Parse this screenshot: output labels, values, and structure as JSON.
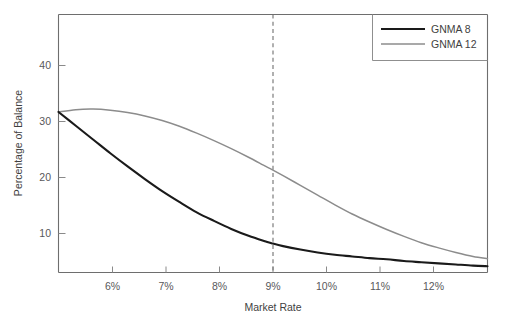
{
  "chart_data": {
    "type": "line",
    "title": "",
    "xlabel": "Market Rate",
    "ylabel": "Percentage of Balance",
    "xlim": [
      5.3,
      12.75
    ],
    "ylim": [
      2.0,
      47.0
    ],
    "grid": false,
    "legend_position": "top-right",
    "x_tick_labels": [
      "6%",
      "7%",
      "8%",
      "9%",
      "10%",
      "11%",
      "12%"
    ],
    "x_ticks": [
      6,
      7,
      8,
      9,
      10,
      11,
      12
    ],
    "y_tick_labels": [
      "10",
      "20",
      "30",
      "40"
    ],
    "y_ticks": [
      10,
      20,
      30,
      40
    ],
    "annotations": [
      {
        "name": "reference-line",
        "type": "vline",
        "x": 9,
        "style": "dashed"
      }
    ],
    "x": [
      5.3,
      5.6,
      5.9,
      6.2,
      6.5,
      6.8,
      7.1,
      7.4,
      7.7,
      8.0,
      8.3,
      8.6,
      8.9,
      9.0,
      9.2,
      9.5,
      9.8,
      10.1,
      10.4,
      10.7,
      11.0,
      11.3,
      11.6,
      11.9,
      12.2,
      12.5,
      12.75
    ],
    "series": [
      {
        "name": "GNMA 8",
        "color": "#1a1a1a",
        "line_width": 2.1,
        "values": [
          30.0,
          27.6,
          25.2,
          22.8,
          20.5,
          18.3,
          16.2,
          14.3,
          12.5,
          11.0,
          9.6,
          8.4,
          7.4,
          7.1,
          6.6,
          6.0,
          5.5,
          5.1,
          4.8,
          4.5,
          4.3,
          4.0,
          3.8,
          3.6,
          3.4,
          3.2,
          3.1
        ]
      },
      {
        "name": "GNMA 12",
        "color": "#8c8c8c",
        "line_width": 1.5,
        "values": [
          30.0,
          30.4,
          30.5,
          30.3,
          29.9,
          29.3,
          28.5,
          27.5,
          26.3,
          25.0,
          23.6,
          22.1,
          20.5,
          20.0,
          18.9,
          17.2,
          15.5,
          13.8,
          12.2,
          10.8,
          9.5,
          8.3,
          7.2,
          6.3,
          5.5,
          4.8,
          4.4
        ]
      }
    ]
  },
  "legend": {
    "items": [
      {
        "label": "GNMA 8",
        "color": "#1a1a1a"
      },
      {
        "label": "GNMA 12",
        "color": "#8c8c8c"
      }
    ]
  },
  "axes": {
    "x_title": "Market Rate",
    "y_title": "Percentage of Balance",
    "x_labels": [
      "6%",
      "7%",
      "8%",
      "9%",
      "10%",
      "11%",
      "12%"
    ],
    "y_labels": [
      "10",
      "20",
      "30",
      "40"
    ]
  },
  "colors": {
    "series_primary": "#1a1a1a",
    "series_secondary": "#8c8c8c",
    "axis": "#6e6e6e",
    "text": "#3f3f41",
    "background": "#ffffff"
  }
}
